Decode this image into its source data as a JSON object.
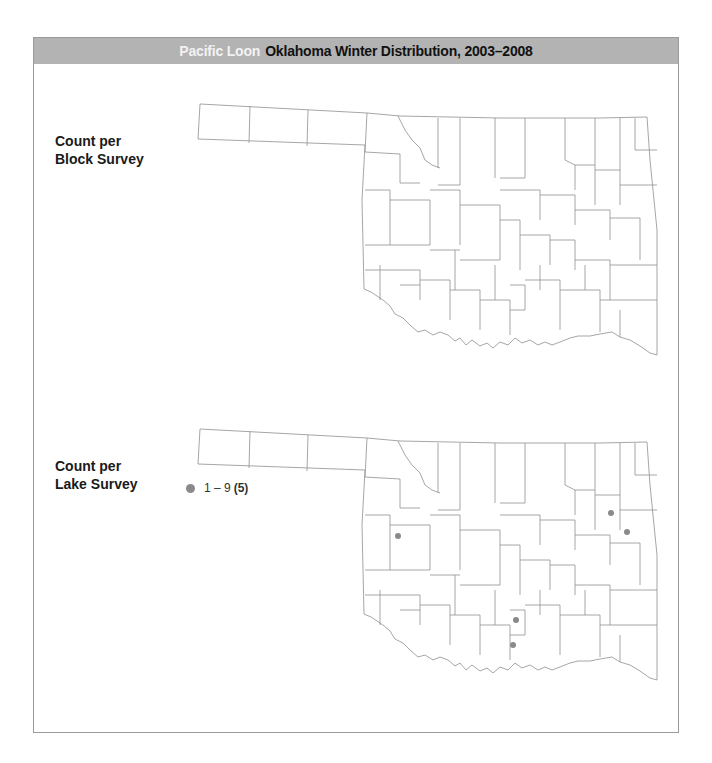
{
  "header": {
    "species": "Pacific Loon",
    "title": "Oklahoma Winter Distribution, 2003–2008",
    "background": "#b3b3b3"
  },
  "panels": [
    {
      "label_line1": "Count per",
      "label_line2": "Block Survey",
      "points": []
    },
    {
      "label_line1": "Count per",
      "label_line2": "Lake Survey",
      "points": [
        {
          "x": 398,
          "y": 536
        },
        {
          "x": 611,
          "y": 513
        },
        {
          "x": 627,
          "y": 532
        },
        {
          "x": 516,
          "y": 620
        },
        {
          "x": 513,
          "y": 645
        }
      ]
    }
  ],
  "legend": {
    "range": "1 – 9",
    "count": "(5)",
    "color": "#8a8a8a"
  },
  "map_style": {
    "stroke": "#8f8f8f",
    "dot_color": "#8a8a8a"
  }
}
